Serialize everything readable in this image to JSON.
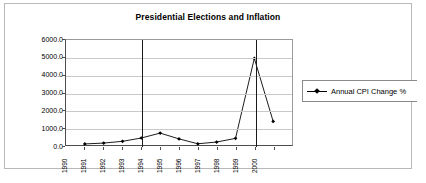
{
  "chart_data": {
    "type": "line",
    "title": "Presidential Elections and Inflation",
    "xlabel": "",
    "ylabel": "",
    "categories": [
      "1990",
      "1991",
      "1992",
      "1993",
      "1994",
      "1995",
      "1996",
      "1997",
      "1998",
      "1999",
      "2000"
    ],
    "series": [
      {
        "name": "Annual CPI Change %",
        "marker": "diamond",
        "values": [
          60,
          110,
          210,
          400,
          680,
          350,
          70,
          170,
          380,
          4950,
          1350
        ]
      }
    ],
    "ylim": [
      0,
      6000
    ],
    "yticks": [
      0,
      1000,
      2000,
      3000,
      4000,
      5000,
      6000
    ],
    "ytick_labels": [
      "0.0",
      "1000.0",
      "2000.0",
      "3000.0",
      "4000.0",
      "5000.0",
      "6000.0"
    ],
    "grid": "horizontal",
    "legend_position": "right",
    "annotations": [
      {
        "kind": "vertical-line",
        "label": "election-marker",
        "category": "1993",
        "value_top": 6000
      },
      {
        "kind": "vertical-line",
        "label": "election-marker",
        "category": "1999",
        "value_top": 6000
      }
    ],
    "colors": {
      "series_line": "#000000",
      "gridline": "#c9c9c9",
      "axis": "#4d4d4d",
      "election_line": "#1a1a1a",
      "frame_border": "#b8b8b8",
      "background": "#ffffff"
    }
  },
  "legend": {
    "entries": [
      {
        "label": "Annual CPI Change %",
        "symbol": "line-diamond-marker"
      }
    ]
  }
}
